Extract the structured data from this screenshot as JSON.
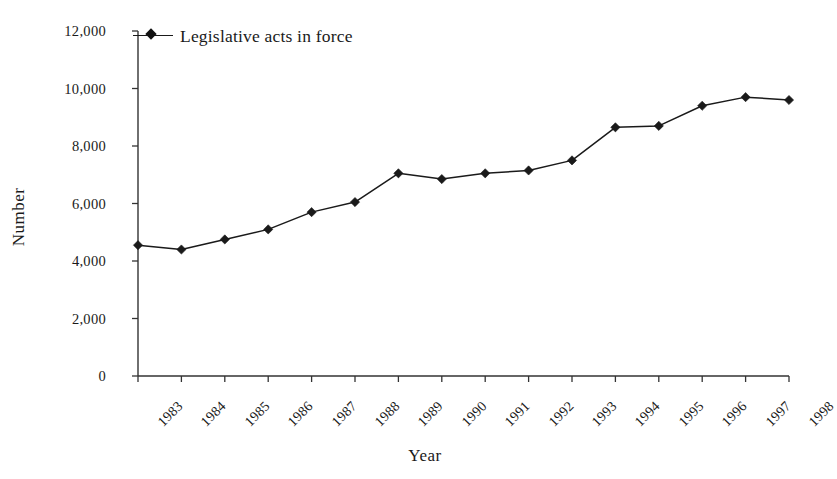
{
  "chart_data": {
    "type": "line",
    "title": "",
    "subtitle": "",
    "xlabel": "Year",
    "ylabel": "Number",
    "categories": [
      "1983",
      "1984",
      "1985",
      "1986",
      "1987",
      "1988",
      "1989",
      "1990",
      "1991",
      "1992",
      "1993",
      "1994",
      "1995",
      "1996",
      "1997",
      "1998"
    ],
    "series": [
      {
        "name": "Legislative acts in force",
        "values": [
          4550,
          4400,
          4750,
          5100,
          5700,
          6050,
          7050,
          6850,
          7050,
          7150,
          7500,
          8650,
          8700,
          9400,
          9700,
          9600
        ],
        "color": "#1a1a1a",
        "marker": "diamond"
      }
    ],
    "ylim": [
      0,
      12000
    ],
    "yticks": [
      0,
      2000,
      4000,
      6000,
      8000,
      10000,
      12000
    ],
    "ytick_labels": [
      "0",
      "2,000",
      "4,000",
      "6,000",
      "8,000",
      "10,000",
      "12,000"
    ],
    "grid": false,
    "legend_position": "top-left",
    "legend_entries": [
      "Legislative acts in force"
    ]
  },
  "legend": {
    "label": "Legislative acts in force"
  },
  "axes": {
    "x_title": "Year",
    "y_title": "Number"
  }
}
